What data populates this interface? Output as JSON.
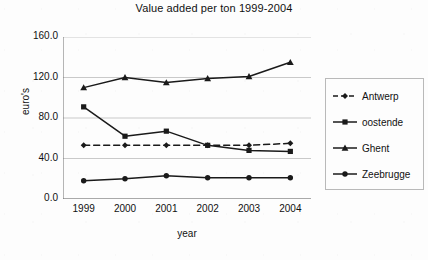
{
  "chart_data": {
    "type": "line",
    "title": "Value added per ton 1999-2004",
    "xlabel": "year",
    "ylabel": "euro's",
    "categories": [
      "1999",
      "2000",
      "2001",
      "2002",
      "2003",
      "2004"
    ],
    "ylim": [
      0,
      160
    ],
    "yticks": [
      "0.0",
      "40.0",
      "80.0",
      "120.0",
      "160.0"
    ],
    "ytick_values": [
      0,
      40,
      80,
      120,
      160
    ],
    "grid": "horizontal",
    "legend_position": "right",
    "series": [
      {
        "name": "Antwerp",
        "marker": "diamond",
        "line_style": "dashed",
        "color": "#1a1a1a",
        "values": [
          53,
          53,
          53,
          53,
          53,
          55
        ]
      },
      {
        "name": "oostende",
        "marker": "square",
        "line_style": "solid",
        "color": "#1a1a1a",
        "values": [
          91,
          62,
          67,
          53,
          48,
          47
        ]
      },
      {
        "name": "Ghent",
        "marker": "triangle",
        "line_style": "solid",
        "color": "#1a1a1a",
        "values": [
          110,
          120,
          115,
          119,
          121,
          135
        ]
      },
      {
        "name": "Zeebrugge",
        "marker": "circle",
        "line_style": "solid",
        "color": "#1a1a1a",
        "values": [
          18,
          20,
          23,
          21,
          21,
          21
        ]
      }
    ]
  },
  "legend": {
    "items": [
      {
        "label": "Antwerp"
      },
      {
        "label": "oostende"
      },
      {
        "label": "Ghent"
      },
      {
        "label": "Zeebrugge"
      }
    ]
  },
  "colors": {
    "ink": "#1a1a1a",
    "gridline": "#c9c9c9",
    "axis": "#6e6e6e",
    "legend_border": "#b9b9b9",
    "background": "#fdfdfd"
  }
}
